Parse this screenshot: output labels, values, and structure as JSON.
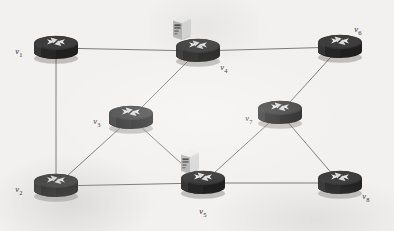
{
  "diagram": {
    "background_color": "#f2f1ef",
    "link_color": "#6e6e6e",
    "router_color": "#2e2e2e",
    "server_color": "#d9d9d9",
    "nodes": [
      {
        "id": "v1",
        "label": "v",
        "subscript": "1",
        "icon": "router-icon",
        "x": 56,
        "y": 48,
        "label_x": 19,
        "label_y": 52,
        "server": false
      },
      {
        "id": "v2",
        "label": "v",
        "subscript": "2",
        "icon": "router-icon",
        "x": 56,
        "y": 186,
        "label_x": 19,
        "label_y": 190,
        "server": false
      },
      {
        "id": "v3",
        "label": "v",
        "subscript": "3",
        "icon": "router-icon",
        "x": 131,
        "y": 118,
        "label_x": 97,
        "label_y": 122,
        "server": false
      },
      {
        "id": "v4",
        "label": "v",
        "subscript": "4",
        "icon": "router-icon",
        "x": 198,
        "y": 51,
        "label_x": 224,
        "label_y": 68,
        "server": true,
        "server_x": 182,
        "server_y": 27
      },
      {
        "id": "v5",
        "label": "v",
        "subscript": "5",
        "icon": "router-icon",
        "x": 203,
        "y": 183,
        "label_x": 203,
        "label_y": 212,
        "server": true,
        "server_x": 190,
        "server_y": 161
      },
      {
        "id": "v6",
        "label": "v",
        "subscript": "6",
        "icon": "router-icon",
        "x": 340,
        "y": 47,
        "label_x": 358,
        "label_y": 30,
        "server": false
      },
      {
        "id": "v7",
        "label": "v",
        "subscript": "7",
        "icon": "router-icon",
        "x": 280,
        "y": 113,
        "label_x": 249,
        "label_y": 119,
        "server": false
      },
      {
        "id": "v8",
        "label": "v",
        "subscript": "8",
        "icon": "router-icon",
        "x": 340,
        "y": 183,
        "label_x": 366,
        "label_y": 197,
        "server": false
      }
    ],
    "links": [
      {
        "id": "v1-v4",
        "from": "v1",
        "to": "v4"
      },
      {
        "id": "v1-v2",
        "from": "v1",
        "to": "v2"
      },
      {
        "id": "v2-v3",
        "from": "v2",
        "to": "v3"
      },
      {
        "id": "v2-v5",
        "from": "v2",
        "to": "v5"
      },
      {
        "id": "v3-v4",
        "from": "v3",
        "to": "v4"
      },
      {
        "id": "v3-v5",
        "from": "v3",
        "to": "v5"
      },
      {
        "id": "v4-v6",
        "from": "v4",
        "to": "v6"
      },
      {
        "id": "v5-v7",
        "from": "v5",
        "to": "v7"
      },
      {
        "id": "v5-v8",
        "from": "v5",
        "to": "v8"
      },
      {
        "id": "v6-v7",
        "from": "v6",
        "to": "v7"
      },
      {
        "id": "v7-v8",
        "from": "v7",
        "to": "v8"
      }
    ]
  }
}
